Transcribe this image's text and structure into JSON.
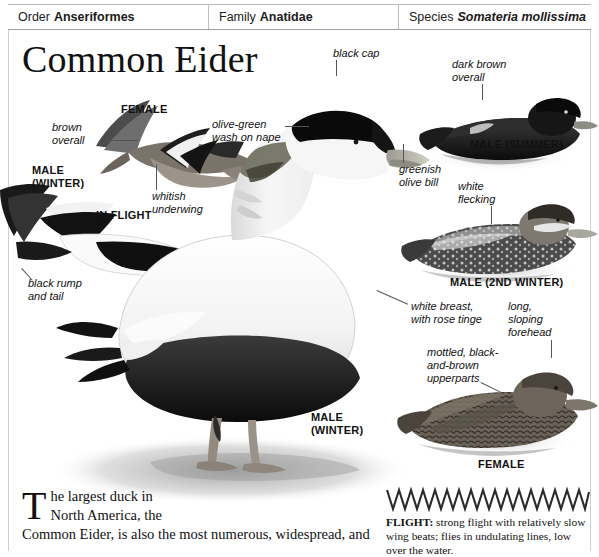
{
  "taxonomy": {
    "order_key": "Order",
    "order_value": "Anseriformes",
    "family_key": "Family",
    "family_value": "Anatidae",
    "species_key": "Species",
    "species_value": "Somateria mollissima"
  },
  "page": {
    "title": "Common Eider"
  },
  "labels": {
    "brown_overall": "brown\noverall",
    "female_flight": "FEMALE",
    "male_winter_flight": "MALE\n(WINTER)",
    "in_flight": "IN FLIGHT",
    "whitish_underwing": "whitish\nunderwing",
    "black_rump_and_tail": "black rump\nand tail",
    "black_cap": "black cap",
    "olive_green_wash": "olive-green\nwash on nape",
    "greenish_olive_bill": "greenish\nolive bill",
    "male_winter_main": "MALE\n(WINTER)",
    "dark_brown_overall": "dark brown\noverall",
    "male_summer": "MALE (SUMMER)",
    "white_flecking": "white\nflecking",
    "male_2nd_winter": "MALE (2ND WINTER)",
    "white_breast": "white breast,\nwith rose tinge",
    "long_sloping_forehead": "long,\nsloping\nforehead",
    "mottled_upperparts": "mottled, black-\nand-brown\nupperparts",
    "female_swimming": "FEMALE"
  },
  "flight": {
    "heading": "FLIGHT:",
    "text": " strong flight with relatively slow wing beats; flies in undulating lines, low over the water."
  },
  "body": {
    "dropcap": "T",
    "line1": "he largest duck in",
    "line2": "North America, the",
    "line3": "Common Eider, is also the most numerous, widespread, and"
  },
  "colors": {
    "rule": "#cfcfcf",
    "text": "#111111",
    "leader": "#555555"
  }
}
